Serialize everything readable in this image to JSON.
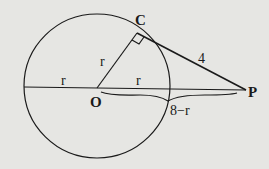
{
  "diagram": {
    "labels": {
      "point_C": "C",
      "point_O": "O",
      "point_P": "P",
      "radius_OC": "r",
      "radius_left": "r",
      "radius_right": "r",
      "tangent_CP": "4",
      "segment_OP_outside": "8−r"
    },
    "colors": {
      "background": "#e6e6e3",
      "ink": "#1a1a1a"
    }
  }
}
